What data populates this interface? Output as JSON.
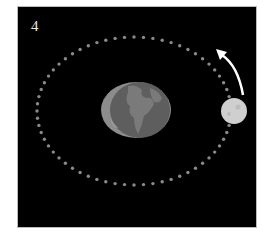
{
  "figure": {
    "panel_number": "4",
    "colors": {
      "background": "#000000",
      "orbit_dots": "#8a8a8a",
      "earth": "#6e6e6e",
      "earth_rim": "#8f8f8f",
      "moon": "#cfcfcf",
      "arrow": "#ffffff"
    },
    "objects": [
      {
        "name": "earth",
        "cx": 136,
        "cy": 110,
        "rx": 35,
        "ry": 28
      },
      {
        "name": "moon",
        "cx": 234,
        "cy": 111,
        "r": 13
      },
      {
        "name": "orbit",
        "cx": 134,
        "cy": 111,
        "rx": 97,
        "ry": 74,
        "dot_count": 64
      },
      {
        "name": "direction-arrow",
        "from": [
          243,
          95
        ],
        "to": [
          219,
          50
        ],
        "direction": "counterclockwise"
      }
    ]
  }
}
